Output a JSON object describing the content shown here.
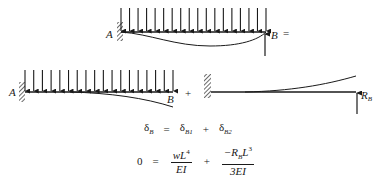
{
  "figure": {
    "top_diagram": {
      "description": "Propped cantilever beam with uniform distributed load, fixed at A, roller support at B",
      "label_left": "A",
      "label_right": "B",
      "operator": "=",
      "load_arrow_count": 18
    },
    "bottom_left_diagram": {
      "description": "Cantilever beam under uniform distributed load (reaction removed)",
      "label_left": "A",
      "label_right": "B",
      "load_arrow_count": 18
    },
    "plus_operator": "+",
    "bottom_right_diagram": {
      "description": "Cantilever beam with upward point load R_B at free end",
      "reaction_label_main": "R",
      "reaction_label_sub": "B"
    },
    "equations": {
      "compatibility": {
        "lhs_symbol": "δ",
        "lhs_sub": "B",
        "equals": "=",
        "term1_symbol": "δ",
        "term1_sub": "B1",
        "plus": "+",
        "term2_symbol": "δ",
        "term2_sub": "B2"
      },
      "substituted": {
        "lhs": "0",
        "equals": "=",
        "frac1_num_w": "wL",
        "frac1_num_exp": "4",
        "frac1_den": "EI",
        "plus": "+",
        "frac2_num_sign": "−R",
        "frac2_num_sub": "B",
        "frac2_num_L": "L",
        "frac2_num_exp": "3",
        "frac2_den": "3EI"
      }
    }
  }
}
